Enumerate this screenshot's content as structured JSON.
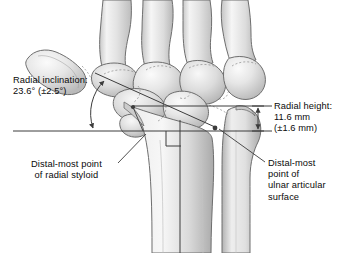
{
  "figure": {
    "view": "posteroanterior wrist radiographic tracing",
    "background_color": "#ffffff",
    "line_color": "#3c3c3c",
    "text_color": "#0a0a0a",
    "bone_fill_light": "#f2f2f2",
    "bone_fill_mid": "#d8d8d8",
    "bone_fill_dark": "#b4b4b4",
    "bone_outline": "#6e6e6e"
  },
  "labels": {
    "radial_inclination": {
      "line1": "Radial inclination:",
      "line2": "23.6° (±2.5°)"
    },
    "radial_height": {
      "line1": "Radial height:",
      "line2": "11.6 mm",
      "line3": "(±1.6 mm)"
    },
    "radial_styloid": {
      "line1": "Distal-most point",
      "line2": "of radial styloid"
    },
    "ulnar_surface": {
      "line1": "Distal-most",
      "line2": "point of",
      "line3": "ulnar articular",
      "line4": "surface"
    }
  },
  "measurements": {
    "radial_inclination_value": "23.6°",
    "radial_inclination_sd": "±2.5°",
    "radial_height_value": "11.6 mm",
    "radial_height_sd": "±1.6 mm"
  },
  "anatomy": {
    "bones": [
      "second metacarpal base",
      "third metacarpal base",
      "fourth metacarpal base",
      "fifth metacarpal base",
      "trapezium",
      "trapezoid",
      "scaphoid",
      "lunate",
      "capitate",
      "hamate",
      "triquetrum",
      "distal radius",
      "radial styloid",
      "distal ulna",
      "ulnar styloid"
    ]
  },
  "annotations": {
    "reference_line_proximal": "horizontal reference line through radial styloid tip",
    "reference_line_distal": "horizontal reference line through ulnar articular surface",
    "oblique_line": "line joining radial styloid tip to ulnar articular distal point",
    "angle_arc": "double-headed arc marking radial inclination angle",
    "height_arrow": "double-headed vertical dimension arrow for radial height",
    "long_axis": "longitudinal axis of the radius shaft",
    "right_angle_marker": "perpendicular square marker at long axis"
  }
}
